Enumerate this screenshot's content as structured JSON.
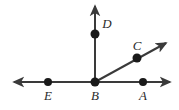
{
  "figure": {
    "kind": "geometry-diagram",
    "width": 179,
    "height": 110,
    "background_color": "#ffffff",
    "stroke_color": "#3a3a3a",
    "point_color": "#1a1a1a",
    "label_color": "#2b2b2b",
    "stroke_width": 2,
    "point_radius": 4,
    "points": [
      {
        "id": "E",
        "label": "E",
        "x": 48,
        "y": 82,
        "label_x": 48,
        "label_y": 100
      },
      {
        "id": "B",
        "label": "B",
        "x": 95,
        "y": 82,
        "label_x": 95,
        "label_y": 100
      },
      {
        "id": "A",
        "label": "A",
        "x": 143,
        "y": 82,
        "label_x": 143,
        "label_y": 100
      },
      {
        "id": "D",
        "label": "D",
        "x": 95,
        "y": 34,
        "label_x": 107,
        "label_y": 28
      },
      {
        "id": "C",
        "label": "C",
        "x": 137,
        "y": 58,
        "label_x": 137,
        "label_y": 50
      }
    ],
    "lines": [
      {
        "id": "horizontal-line",
        "x1": 14,
        "y1": 82,
        "x2": 170,
        "y2": 82,
        "arrow_start": true,
        "arrow_end": true
      },
      {
        "id": "vertical-ray",
        "x1": 95,
        "y1": 82,
        "x2": 95,
        "y2": 6,
        "arrow_start": false,
        "arrow_end": true
      },
      {
        "id": "diagonal-ray",
        "x1": 95,
        "y1": 82,
        "x2": 166,
        "y2": 43,
        "arrow_start": false,
        "arrow_end": true
      }
    ]
  }
}
